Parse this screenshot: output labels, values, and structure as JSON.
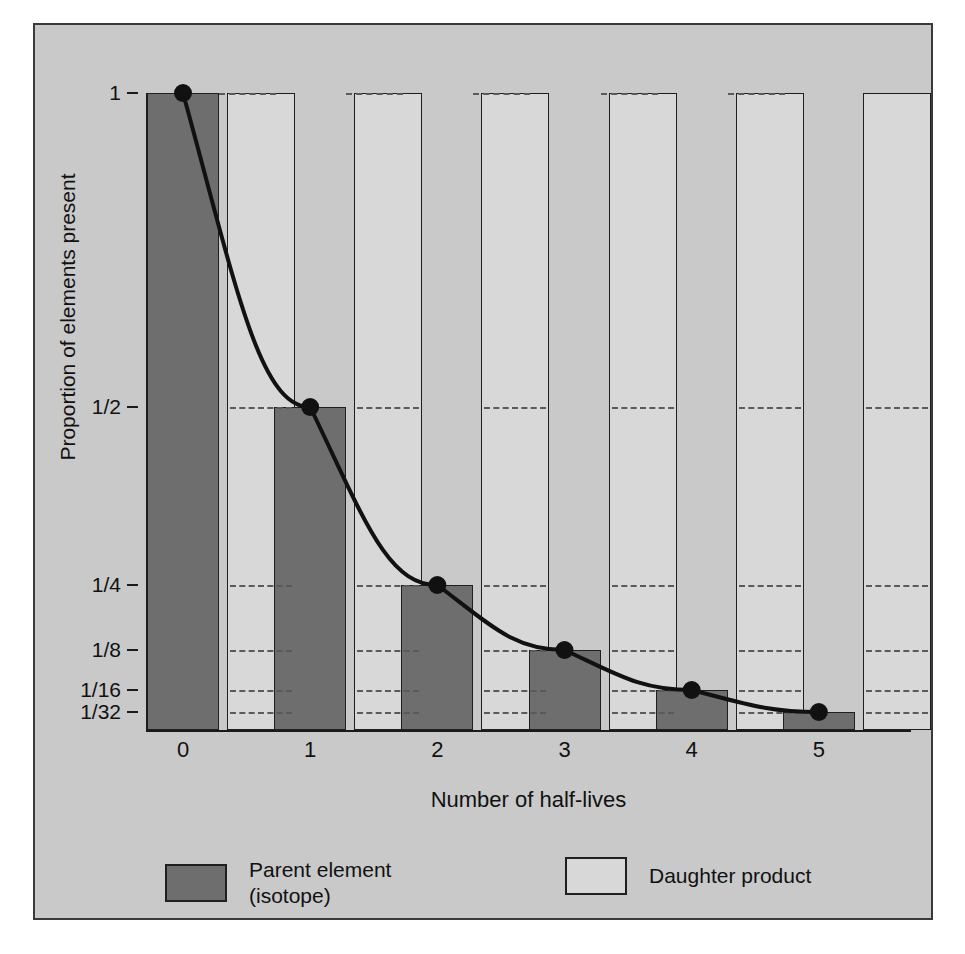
{
  "chart_data": {
    "type": "bar",
    "title": "",
    "xlabel": "Number of half-lives",
    "ylabel": "Proportion of elements present",
    "categories": [
      "0",
      "1",
      "2",
      "3",
      "4",
      "5"
    ],
    "x": [
      0,
      1,
      2,
      3,
      4,
      5
    ],
    "grid": true,
    "legend_position": "bottom",
    "xlim": [
      0,
      5
    ],
    "ylim": [
      0,
      1
    ],
    "y_ticks": [
      {
        "label": "1",
        "value": 1
      },
      {
        "label": "1/2",
        "value": 0.5
      },
      {
        "label": "1/4",
        "value": 0.25
      },
      {
        "label": "1/8",
        "value": 0.125
      },
      {
        "label": "1/16",
        "value": 0.0625
      },
      {
        "label": "1/32",
        "value": 0.03125
      }
    ],
    "series": [
      {
        "name": "Parent element (isotope)",
        "color": "#6e6e6e",
        "values": [
          1,
          0.5,
          0.25,
          0.125,
          0.0625,
          0.03125
        ]
      },
      {
        "name": "Daughter product",
        "color": "#d8d8d8",
        "values": [
          1,
          1,
          1,
          1,
          1,
          1
        ]
      }
    ],
    "curve": {
      "name": "decay curve",
      "color": "#111111",
      "points": [
        {
          "x": 0,
          "y": 1
        },
        {
          "x": 1,
          "y": 0.5
        },
        {
          "x": 2,
          "y": 0.25
        },
        {
          "x": 3,
          "y": 0.125
        },
        {
          "x": 4,
          "y": 0.0625
        },
        {
          "x": 5,
          "y": 0.03125
        }
      ]
    }
  },
  "axes": {
    "y_title": "Proportion of elements present",
    "x_title": "Number of half-lives",
    "y_tick_labels": [
      "1",
      "1/2",
      "1/4",
      "1/8",
      "1/16",
      "1/32"
    ],
    "x_tick_labels": [
      "0",
      "1",
      "2",
      "3",
      "4",
      "5"
    ]
  },
  "legend": {
    "parent": {
      "label": "Parent element\n(isotope)",
      "swatch": "parent-swatch",
      "color": "#6e6e6e"
    },
    "daughter": {
      "label": "Daughter product",
      "swatch": "daughter-swatch",
      "color": "#d8d8d8"
    }
  },
  "colors": {
    "figure_background": "#c9c9c9",
    "parent_fill": "#6e6e6e",
    "daughter_fill": "#d8d8d8",
    "outline": "#1f1f1f",
    "curve": "#111111",
    "gridline": "#5a5a5a"
  }
}
